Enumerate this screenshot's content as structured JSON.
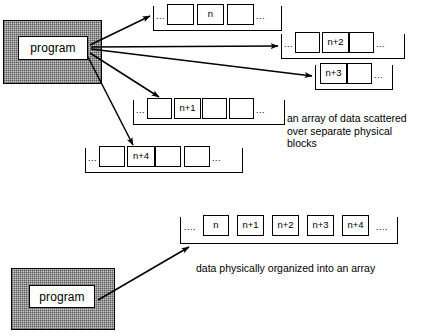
{
  "diagram": {
    "colors": {
      "shade_fill": "#c9c9c9",
      "line": "#000000",
      "cell_fill": "#ffffff",
      "background": "#ffffff"
    },
    "top": {
      "program_label": "program",
      "caption": "an array of data scattered\nover separate physical\nblocks",
      "blocks": [
        {
          "id": "block-n",
          "lead_ellipsis": "...",
          "trail_ellipsis": "...",
          "cells": [
            "",
            "n",
            ""
          ]
        },
        {
          "id": "block-n-plus-2",
          "lead_ellipsis": "...",
          "trail_ellipsis": "...",
          "cells": [
            "",
            "n+2",
            ""
          ]
        },
        {
          "id": "block-n-plus-3",
          "lead_ellipsis": "",
          "trail_ellipsis": "...",
          "cells": [
            "n+3",
            ""
          ]
        },
        {
          "id": "block-n-plus-1",
          "lead_ellipsis": "...",
          "trail_ellipsis": "...",
          "cells": [
            "",
            "n+1",
            "",
            ""
          ]
        },
        {
          "id": "block-n-plus-4",
          "lead_ellipsis": "...",
          "trail_ellipsis": "...",
          "cells": [
            "",
            "n+4",
            "",
            ""
          ]
        }
      ]
    },
    "bottom": {
      "program_label": "program",
      "caption": "data physically organized into an array",
      "array": {
        "id": "contiguous-array",
        "lead_ellipsis": "....",
        "trail_ellipsis": "....",
        "cells": [
          "n",
          "n+1",
          "n+2",
          "n+3",
          "n+4"
        ]
      }
    }
  }
}
